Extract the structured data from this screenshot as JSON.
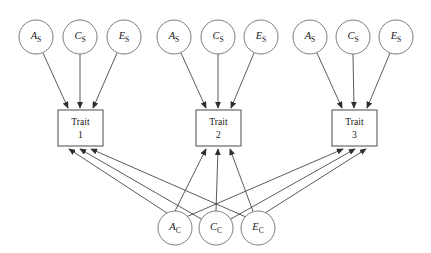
{
  "figure": {
    "type": "path-diagram",
    "canvas": {
      "width": 431,
      "height": 253,
      "background": "#ffffff"
    },
    "colors": {
      "circle_stroke": "#6f6f6f",
      "rect_stroke": "#4a4a4a",
      "path_stroke": "#3d3d3d",
      "text": "#1a1a1a",
      "background": "#ffffff"
    }
  },
  "specific_factors": [
    {
      "group": 1,
      "nodes": [
        {
          "id": "A_S_1",
          "var": "A",
          "sub": "S",
          "cx": 36,
          "cy": 37,
          "r": 17
        },
        {
          "id": "C_S_1",
          "var": "C",
          "sub": "S",
          "cx": 80,
          "cy": 37,
          "r": 17
        },
        {
          "id": "E_S_1",
          "var": "E",
          "sub": "S",
          "cx": 124,
          "cy": 37,
          "r": 17
        }
      ]
    },
    {
      "group": 2,
      "nodes": [
        {
          "id": "A_S_2",
          "var": "A",
          "sub": "S",
          "cx": 174,
          "cy": 37,
          "r": 17
        },
        {
          "id": "C_S_2",
          "var": "C",
          "sub": "S",
          "cx": 218,
          "cy": 37,
          "r": 17
        },
        {
          "id": "E_S_2",
          "var": "E",
          "sub": "S",
          "cx": 261,
          "cy": 37,
          "r": 17
        }
      ]
    },
    {
      "group": 3,
      "nodes": [
        {
          "id": "A_S_3",
          "var": "A",
          "sub": "S",
          "cx": 310,
          "cy": 37,
          "r": 17
        },
        {
          "id": "C_S_3",
          "var": "C",
          "sub": "S",
          "cx": 353,
          "cy": 37,
          "r": 17
        },
        {
          "id": "E_S_3",
          "var": "E",
          "sub": "S",
          "cx": 396,
          "cy": 37,
          "r": 17
        }
      ]
    }
  ],
  "common_factors": [
    {
      "id": "A_C",
      "var": "A",
      "sub": "C",
      "cx": 175,
      "cy": 228,
      "r": 17
    },
    {
      "id": "C_C",
      "var": "C",
      "sub": "C",
      "cx": 216,
      "cy": 228,
      "r": 17
    },
    {
      "id": "E_C",
      "var": "E",
      "sub": "C",
      "cx": 258,
      "cy": 228,
      "r": 17
    }
  ],
  "traits": [
    {
      "id": "trait1",
      "line1": "Trait",
      "line2": "1",
      "x": 58,
      "y": 110,
      "w": 45,
      "h": 36
    },
    {
      "id": "trait2",
      "line1": "Trait",
      "line2": "2",
      "x": 196,
      "y": 110,
      "w": 45,
      "h": 36
    },
    {
      "id": "trait3",
      "line1": "Trait",
      "line2": "3",
      "x": 332,
      "y": 110,
      "w": 45,
      "h": 36
    }
  ],
  "paths": {
    "specific_to_trait": [
      {
        "from": "A_S_1",
        "to": "trait1",
        "x1": 43,
        "y1": 53,
        "x2": 68,
        "y2": 108
      },
      {
        "from": "C_S_1",
        "to": "trait1",
        "x1": 80,
        "y1": 54,
        "x2": 80,
        "y2": 108
      },
      {
        "from": "E_S_1",
        "to": "trait1",
        "x1": 117,
        "y1": 53,
        "x2": 93,
        "y2": 108
      },
      {
        "from": "A_S_2",
        "to": "trait2",
        "x1": 181,
        "y1": 53,
        "x2": 206,
        "y2": 108
      },
      {
        "from": "C_S_2",
        "to": "trait2",
        "x1": 218,
        "y1": 54,
        "x2": 218,
        "y2": 108
      },
      {
        "from": "E_S_2",
        "to": "trait2",
        "x1": 254,
        "y1": 53,
        "x2": 231,
        "y2": 108
      },
      {
        "from": "A_S_3",
        "to": "trait3",
        "x1": 317,
        "y1": 53,
        "x2": 342,
        "y2": 108
      },
      {
        "from": "C_S_3",
        "to": "trait3",
        "x1": 353,
        "y1": 54,
        "x2": 354,
        "y2": 108
      },
      {
        "from": "E_S_3",
        "to": "trait3",
        "x1": 390,
        "y1": 53,
        "x2": 367,
        "y2": 108
      }
    ],
    "common_to_trait": [
      {
        "from": "A_C",
        "to": "trait1",
        "x1": 167,
        "y1": 213,
        "x2": 69,
        "y2": 149
      },
      {
        "from": "A_C",
        "to": "trait2",
        "x1": 175,
        "y1": 211,
        "x2": 206,
        "y2": 149
      },
      {
        "from": "A_C",
        "to": "trait3",
        "x1": 186,
        "y1": 217,
        "x2": 343,
        "y2": 149
      },
      {
        "from": "C_C",
        "to": "trait1",
        "x1": 203,
        "y1": 220,
        "x2": 80,
        "y2": 149
      },
      {
        "from": "C_C",
        "to": "trait2",
        "x1": 216,
        "y1": 211,
        "x2": 218,
        "y2": 149
      },
      {
        "from": "C_C",
        "to": "trait3",
        "x1": 229,
        "y1": 220,
        "x2": 355,
        "y2": 149
      },
      {
        "from": "E_C",
        "to": "trait1",
        "x1": 246,
        "y1": 217,
        "x2": 91,
        "y2": 149
      },
      {
        "from": "E_C",
        "to": "trait2",
        "x1": 254,
        "y1": 214,
        "x2": 230,
        "y2": 149
      },
      {
        "from": "E_C",
        "to": "trait3",
        "x1": 265,
        "y1": 213,
        "x2": 366,
        "y2": 149
      }
    ]
  }
}
